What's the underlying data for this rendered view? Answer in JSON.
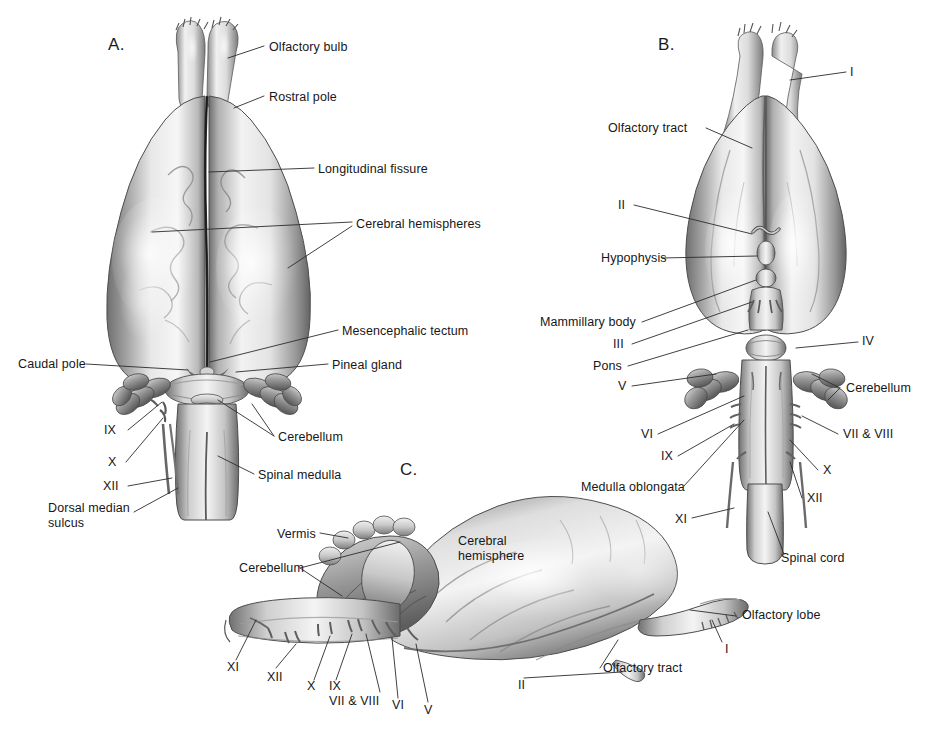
{
  "figure": {
    "background_color": "#ffffff",
    "ink_color": "#171717",
    "leader_color": "#2b2b2b"
  },
  "panels": [
    {
      "id": "A",
      "letter": "A.",
      "view": "dorsal view of brain"
    },
    {
      "id": "B",
      "letter": "B.",
      "view": "ventral view of brain"
    },
    {
      "id": "C",
      "letter": "C.",
      "view": "lateral view of brain"
    }
  ],
  "panel_a": {
    "letter": "A.",
    "labels": [
      {
        "key": "olfactory_bulb",
        "text": "Olfactory bulb"
      },
      {
        "key": "rostral_pole",
        "text": "Rostral pole"
      },
      {
        "key": "longitudinal_fissure",
        "text": "Longitudinal fissure"
      },
      {
        "key": "cerebral_hemispheres",
        "text": "Cerebral hemispheres"
      },
      {
        "key": "mesencephalic_tectum",
        "text": "Mesencephalic tectum"
      },
      {
        "key": "pineal_gland",
        "text": "Pineal gland"
      },
      {
        "key": "caudal_pole",
        "text": "Caudal pole"
      },
      {
        "key": "cerebellum",
        "text": "Cerebellum"
      },
      {
        "key": "spinal_medulla",
        "text": "Spinal medulla"
      },
      {
        "key": "dorsal_median_sulcus",
        "text": "Dorsal median sulcus"
      },
      {
        "key": "nerve_ix",
        "text": "IX"
      },
      {
        "key": "nerve_x",
        "text": "X"
      },
      {
        "key": "nerve_xii",
        "text": "XII"
      }
    ]
  },
  "panel_b": {
    "letter": "B.",
    "labels": [
      {
        "key": "nerve_i",
        "text": "I"
      },
      {
        "key": "olfactory_tract",
        "text": "Olfactory tract"
      },
      {
        "key": "nerve_ii",
        "text": "II"
      },
      {
        "key": "hypophysis",
        "text": "Hypophysis"
      },
      {
        "key": "mammillary_body",
        "text": "Mammillary body"
      },
      {
        "key": "nerve_iii",
        "text": "III"
      },
      {
        "key": "pons",
        "text": "Pons"
      },
      {
        "key": "nerve_v",
        "text": "V"
      },
      {
        "key": "nerve_vi",
        "text": "VI"
      },
      {
        "key": "nerve_ix",
        "text": "IX"
      },
      {
        "key": "medulla_oblongata",
        "text": "Medulla oblongata"
      },
      {
        "key": "nerve_xi",
        "text": "XI"
      },
      {
        "key": "nerve_iv",
        "text": "IV"
      },
      {
        "key": "cerebellum",
        "text": "Cerebellum"
      },
      {
        "key": "nerve_vii_viii",
        "text": "VII & VIII"
      },
      {
        "key": "nerve_x",
        "text": "X"
      },
      {
        "key": "nerve_xii",
        "text": "XII"
      },
      {
        "key": "spinal_cord",
        "text": "Spinal cord"
      }
    ]
  },
  "panel_c": {
    "letter": "C.",
    "labels": [
      {
        "key": "vermis",
        "text": "Vermis"
      },
      {
        "key": "cerebellum",
        "text": "Cerebellum"
      },
      {
        "key": "cerebral_hemisphere",
        "text": "Cerebral\nhemisphere"
      },
      {
        "key": "cerebral_hemisphere_l1",
        "text": "Cerebral"
      },
      {
        "key": "cerebral_hemisphere_l2",
        "text": "hemisphere"
      },
      {
        "key": "olfactory_lobe",
        "text": "Olfactory lobe"
      },
      {
        "key": "olfactory_tract",
        "text": "Olfactory tract"
      },
      {
        "key": "nerve_i",
        "text": "I"
      },
      {
        "key": "nerve_ii",
        "text": "II"
      },
      {
        "key": "nerve_v",
        "text": "V"
      },
      {
        "key": "nerve_vi",
        "text": "VI"
      },
      {
        "key": "nerve_vii_viii",
        "text": "VII & VIII"
      },
      {
        "key": "nerve_ix",
        "text": "IX"
      },
      {
        "key": "nerve_x",
        "text": "X"
      },
      {
        "key": "nerve_xi",
        "text": "XI"
      },
      {
        "key": "nerve_xii",
        "text": "XII"
      }
    ]
  }
}
